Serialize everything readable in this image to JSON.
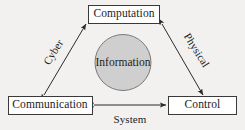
{
  "diagram": {
    "background_color": "#f2f1ef",
    "stroke_color": "#2b2b2b",
    "node_fill": "#ffffff",
    "hub_fill": "#cfcfcf",
    "nodes": [
      {
        "id": "computation",
        "label": "Computation",
        "shape": "rect"
      },
      {
        "id": "communication",
        "label": "Communication",
        "shape": "rect"
      },
      {
        "id": "control",
        "label": "Control",
        "shape": "rect"
      },
      {
        "id": "information",
        "label": "Information",
        "shape": "circle"
      }
    ],
    "edges": [
      {
        "id": "cyber",
        "label": "Cyber",
        "from": "communication",
        "to": "computation",
        "arrow": "double"
      },
      {
        "id": "physical",
        "label": "Physical",
        "from": "computation",
        "to": "control",
        "arrow": "double"
      },
      {
        "id": "system",
        "label": "System",
        "from": "communication",
        "to": "control",
        "arrow": "double"
      }
    ]
  }
}
